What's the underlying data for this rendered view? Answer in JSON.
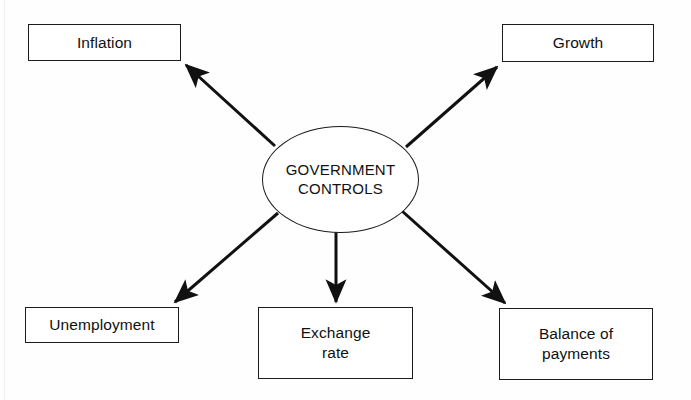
{
  "diagram": {
    "type": "hub-and-spoke",
    "title": "",
    "hub": {
      "id": "government-controls",
      "label": "GOVERNMENT\nCONTROLS",
      "shape": "ellipse"
    },
    "nodes": [
      {
        "id": "inflation",
        "label": "Inflation",
        "shape": "rectangle",
        "position": "top-left"
      },
      {
        "id": "growth",
        "label": "Growth",
        "shape": "rectangle",
        "position": "top-right"
      },
      {
        "id": "unemployment",
        "label": "Unemployment",
        "shape": "rectangle",
        "position": "bottom-left"
      },
      {
        "id": "exchange-rate",
        "label": "Exchange\nrate",
        "shape": "rectangle",
        "position": "bottom-center"
      },
      {
        "id": "balance",
        "label": "Balance of\npayments",
        "shape": "rectangle",
        "position": "bottom-right"
      }
    ],
    "edges": [
      {
        "from": "government-controls",
        "to": "inflation",
        "arrow": "to",
        "direction": "up-left"
      },
      {
        "from": "government-controls",
        "to": "growth",
        "arrow": "to",
        "direction": "up-right"
      },
      {
        "from": "government-controls",
        "to": "unemployment",
        "arrow": "to",
        "direction": "down-left"
      },
      {
        "from": "government-controls",
        "to": "exchange-rate",
        "arrow": "to",
        "direction": "down"
      },
      {
        "from": "government-controls",
        "to": "balance",
        "arrow": "to",
        "direction": "down-right"
      }
    ],
    "colors": {
      "stroke": "#1c1c1c",
      "fill": "#ffffff",
      "text": "#111111",
      "background": "#fefefe"
    }
  }
}
